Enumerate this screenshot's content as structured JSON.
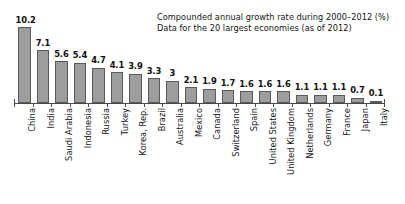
{
  "chart_data": {
    "type": "bar",
    "title": "",
    "annotation_lines": [
      "Compounded annual growth rate during 2000–2012 (%)",
      "Data for the 20 largest economies (as of 2012)"
    ],
    "categories": [
      "China",
      "India",
      "Saudi Arabia",
      "Indonesia",
      "Russia",
      "Turkey",
      "Korea, Rep.",
      "Brazil",
      "Australia",
      "Mexico",
      "Canada",
      "Switzerland",
      "Spain",
      "United States",
      "United Kingdom",
      "Netherlands",
      "Germany",
      "France",
      "Japan",
      "Italy"
    ],
    "values": [
      10.2,
      7.1,
      5.6,
      5.4,
      4.7,
      4.1,
      3.9,
      3.3,
      3,
      2.1,
      1.9,
      1.7,
      1.6,
      1.6,
      1.6,
      1.1,
      1.1,
      1.1,
      0.7,
      0.1
    ],
    "value_labels": [
      "10.2",
      "7.1",
      "5.6",
      "5.4",
      "4.7",
      "4.1",
      "3.9",
      "3.3",
      "3",
      "2.1",
      "1.9",
      "1.7",
      "1.6",
      "1.6",
      "1.6",
      "1.1",
      "1.1",
      "1.1",
      "0.7",
      "0.1"
    ],
    "xlabel": "",
    "ylabel": "",
    "ylim": [
      0,
      10.2
    ],
    "grid": false,
    "legend": "none",
    "bar_color": "#9d9d9d",
    "bar_edge_color": "#5a5a5a",
    "axis_color": "#4a4a4a",
    "background_color": "#ffffff"
  }
}
